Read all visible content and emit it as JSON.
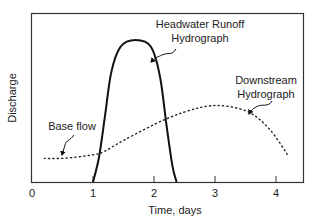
{
  "chart_data": {
    "type": "line",
    "title": "",
    "xlabel": "Time, days",
    "ylabel": "Discharge",
    "xlim": [
      0,
      4.45
    ],
    "ylim": [
      0,
      1
    ],
    "grid": false,
    "x_ticks": [
      0,
      1,
      2,
      3,
      4
    ],
    "x_tick_labels": [
      "0",
      "1",
      "2",
      "3",
      "4"
    ],
    "y_ticks": [],
    "series": [
      {
        "name": "Headwater Runoff Hydrograph",
        "style": "solid",
        "x": [
          1.0,
          1.1,
          1.2,
          1.3,
          1.45,
          1.7,
          1.95,
          2.1,
          2.2,
          2.3,
          2.37
        ],
        "y": [
          0.0,
          0.15,
          0.4,
          0.65,
          0.8,
          0.84,
          0.8,
          0.62,
          0.35,
          0.1,
          0.0
        ]
      },
      {
        "name": "Downstream Hydrograph",
        "style": "dotted",
        "x": [
          0.2,
          0.52,
          0.98,
          1.18,
          1.52,
          2.18,
          2.75,
          3.16,
          3.57,
          3.9,
          4.21
        ],
        "y": [
          0.14,
          0.14,
          0.16,
          0.18,
          0.25,
          0.37,
          0.44,
          0.45,
          0.41,
          0.31,
          0.15
        ]
      }
    ],
    "annotations": [
      {
        "text_lines": [
          "Headwater Runoff",
          "Hydrograph"
        ],
        "points_to_series": "Headwater Runoff Hydrograph",
        "target": [
          1.93,
          0.71
        ]
      },
      {
        "text_lines": [
          "Downstream",
          "Hydrograph"
        ],
        "points_to_series": "Downstream Hydrograph",
        "target": [
          3.56,
          0.41
        ]
      },
      {
        "text_lines": [
          "Base flow"
        ],
        "points_to_series": "Downstream Hydrograph",
        "target": [
          0.5,
          0.16
        ]
      }
    ]
  }
}
